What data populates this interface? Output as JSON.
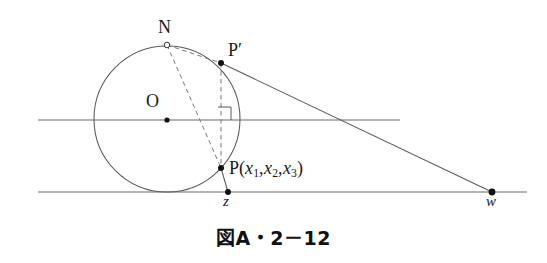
{
  "figure": {
    "type": "geometry-diagram",
    "caption": "図A・2－12",
    "colors": {
      "stroke": "#555555",
      "text": "#1a1a1a",
      "caption": "#111111",
      "background": "#ffffff",
      "point_fill": "#111111"
    },
    "labels": {
      "north_pole": "N",
      "p_prime": "P′",
      "center": "O",
      "point_p_name": "P",
      "point_p_open": "(",
      "point_p_close": ")",
      "point_p_vars": [
        "x",
        "x",
        "x"
      ],
      "point_p_subs": [
        "1",
        "2",
        "3"
      ],
      "z": "z",
      "w": "w"
    },
    "geometry": {
      "circle": {
        "cx": 167,
        "cy": 119,
        "r": 73
      },
      "center_dot": {
        "x": 167,
        "y": 120,
        "r": 2.6
      },
      "north_pole_dot": {
        "x": 167,
        "y": 45,
        "r": 2.6,
        "style": "open"
      },
      "p_prime_dot": {
        "x": 221,
        "y": 63,
        "r": 3.0,
        "style": "filled"
      },
      "p_dot": {
        "x": 221,
        "y": 168,
        "r": 3.0,
        "style": "filled"
      },
      "z_dot": {
        "x": 228,
        "y": 192,
        "r": 3.0,
        "style": "filled"
      },
      "w_dot": {
        "x": 492,
        "y": 192,
        "r": 3.4,
        "style": "filled"
      },
      "upper_line": {
        "x1": 38,
        "y1": 120,
        "x2": 400,
        "y2": 120
      },
      "lower_line": {
        "x1": 38,
        "y1": 192,
        "x2": 527,
        "y2": 192
      },
      "ray_pprime_w": {
        "x1": 221,
        "y1": 63,
        "x2": 492,
        "y2": 192
      },
      "segment_p_z": {
        "x1": 221,
        "y1": 168,
        "x2": 228,
        "y2": 192
      },
      "dashed_n_pprime": {
        "x1": 167,
        "y1": 45,
        "x2": 221,
        "y2": 63
      },
      "dashed_n_p": {
        "x1": 167,
        "y1": 45,
        "x2": 221,
        "y2": 168
      },
      "dashed_pprime_p": {
        "x1": 221,
        "y1": 63,
        "x2": 221,
        "y2": 168
      },
      "right_angle_mark": {
        "x": 218,
        "y": 104,
        "size": 13
      }
    }
  }
}
